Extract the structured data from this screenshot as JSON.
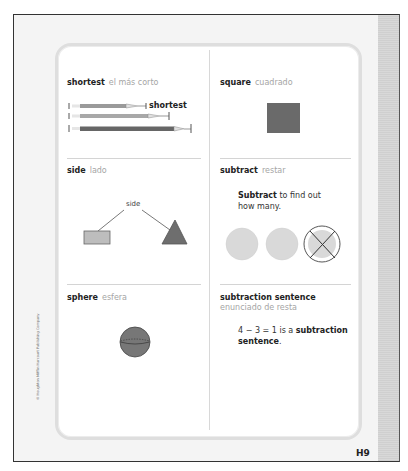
{
  "page": {
    "number": "H9",
    "copyright": "© Houghton Mifflin Harcourt Publishing Company"
  },
  "entries": [
    {
      "term": "shortest",
      "translation": "el más corto",
      "illustration": "three pencils of increasing length",
      "label": "shortest"
    },
    {
      "term": "square",
      "translation": "cuadrado",
      "illustration": "dark gray square"
    },
    {
      "term": "side",
      "translation": "lado",
      "illustration": "rectangle and triangle with lines pointing to sides",
      "label": "side"
    },
    {
      "term": "subtract",
      "translation": "restar",
      "text_bold": "Subtract",
      "text_rest": " to find out how many.",
      "illustration": "three circles, one crossed out"
    },
    {
      "term": "sphere",
      "translation": "esfera",
      "illustration": "gray sphere with dashed equator"
    },
    {
      "term": "subtraction sentence",
      "translation": "enunciado de resta",
      "equation": "4 − 3 = 1",
      "text_mid": " is a ",
      "text_bold": "subtraction sentence",
      "text_end": "."
    }
  ],
  "colors": {
    "shape_dark": "#6e6e6e",
    "shape_light": "#bdbdbd",
    "circle_fill": "#d9d9d9",
    "translation_text": "#a5a5a5"
  }
}
